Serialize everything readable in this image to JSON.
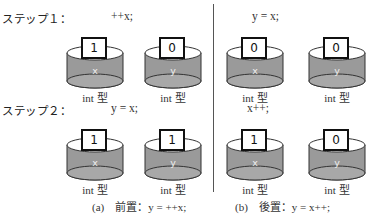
{
  "steps": [
    {
      "label": "ステップ１："
    },
    {
      "label": "ステップ２："
    }
  ],
  "panels": {
    "prefix": {
      "caption": "(a)　前置：y = ++x;",
      "step1": {
        "code": "++x;",
        "vars": [
          {
            "name": "x",
            "value": "1",
            "type": "int 型"
          },
          {
            "name": "y",
            "value": "0",
            "type": "int 型"
          }
        ]
      },
      "step2": {
        "code": "y = x;",
        "vars": [
          {
            "name": "x",
            "value": "1",
            "type": "int 型"
          },
          {
            "name": "y",
            "value": "1",
            "type": "int 型"
          }
        ]
      }
    },
    "postfix": {
      "caption": "(b)　後置：y = x++;",
      "step1": {
        "code": "y = x;",
        "vars": [
          {
            "name": "x",
            "value": "0",
            "type": "int 型"
          },
          {
            "name": "y",
            "value": "0",
            "type": "int 型"
          }
        ]
      },
      "step2": {
        "code": "x++;",
        "vars": [
          {
            "name": "x",
            "value": "1",
            "type": "int 型"
          },
          {
            "name": "y",
            "value": "0",
            "type": "int 型"
          }
        ]
      }
    }
  },
  "colors": {
    "cylinder_body": "#9a9a9a",
    "cylinder_outline": "#333333",
    "cylinder_top": "#ffffff",
    "divider": "#555555"
  }
}
